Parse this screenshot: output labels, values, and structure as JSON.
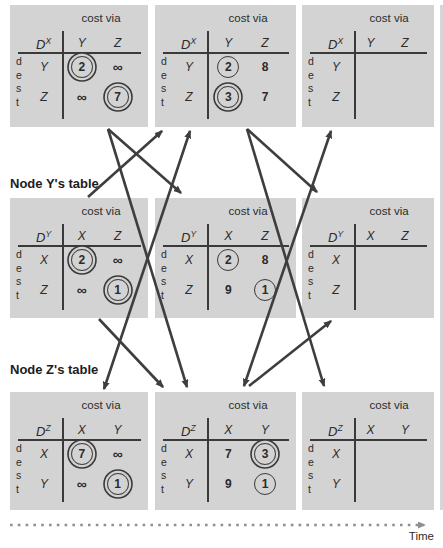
{
  "figure": {
    "header_label": "cost via",
    "dest_label": "d\ne\ns\nt",
    "time_label": "Time",
    "node_y_label": "Node Y's table",
    "node_z_label": "Node Z's table",
    "colors": {
      "table_bg": "#d3d3d3",
      "ink": "#2b2b2b",
      "arrow": "#3e3e3e",
      "timeline": "#8f8f8f"
    },
    "rows": [
      {
        "node": "X",
        "label": null,
        "tables": [
          {
            "d": "D",
            "sup": "X",
            "cols": [
              "Y",
              "Z"
            ],
            "rows": [
              {
                "label": "Y",
                "cells": [
                  {
                    "v": "2",
                    "circle": "double"
                  },
                  {
                    "v": "∞"
                  }
                ]
              },
              {
                "label": "Z",
                "cells": [
                  {
                    "v": "∞"
                  },
                  {
                    "v": "7",
                    "circle": "double"
                  }
                ]
              }
            ]
          },
          {
            "d": "D",
            "sup": "X",
            "cols": [
              "Y",
              "Z"
            ],
            "rows": [
              {
                "label": "Y",
                "cells": [
                  {
                    "v": "2",
                    "circle": "single"
                  },
                  {
                    "v": "8"
                  }
                ]
              },
              {
                "label": "Z",
                "cells": [
                  {
                    "v": "3",
                    "circle": "double"
                  },
                  {
                    "v": "7"
                  }
                ]
              }
            ]
          },
          {
            "d": "D",
            "sup": "X",
            "cols": [
              "Y",
              "Z"
            ],
            "rows": [
              {
                "label": "Y",
                "cells": [
                  {},
                  {}
                ]
              },
              {
                "label": "Z",
                "cells": [
                  {},
                  {}
                ]
              }
            ]
          }
        ]
      },
      {
        "node": "Y",
        "label": "Node Y's table",
        "tables": [
          {
            "d": "D",
            "sup": "Y",
            "cols": [
              "X",
              "Z"
            ],
            "rows": [
              {
                "label": "X",
                "cells": [
                  {
                    "v": "2",
                    "circle": "double"
                  },
                  {
                    "v": "∞"
                  }
                ]
              },
              {
                "label": "Z",
                "cells": [
                  {
                    "v": "∞"
                  },
                  {
                    "v": "1",
                    "circle": "double"
                  }
                ]
              }
            ]
          },
          {
            "d": "D",
            "sup": "Y",
            "cols": [
              "X",
              "Z"
            ],
            "rows": [
              {
                "label": "X",
                "cells": [
                  {
                    "v": "2",
                    "circle": "single"
                  },
                  {
                    "v": "8"
                  }
                ]
              },
              {
                "label": "Z",
                "cells": [
                  {
                    "v": "9"
                  },
                  {
                    "v": "1",
                    "circle": "single"
                  }
                ]
              }
            ]
          },
          {
            "d": "D",
            "sup": "Y",
            "cols": [
              "X",
              "Z"
            ],
            "rows": [
              {
                "label": "X",
                "cells": [
                  {},
                  {}
                ]
              },
              {
                "label": "Z",
                "cells": [
                  {},
                  {}
                ]
              }
            ]
          }
        ]
      },
      {
        "node": "Z",
        "label": "Node Z's table",
        "tables": [
          {
            "d": "D",
            "sup": "Z",
            "cols": [
              "X",
              "Y"
            ],
            "rows": [
              {
                "label": "X",
                "cells": [
                  {
                    "v": "7",
                    "circle": "double"
                  },
                  {
                    "v": "∞"
                  }
                ]
              },
              {
                "label": "Y",
                "cells": [
                  {
                    "v": "∞"
                  },
                  {
                    "v": "1",
                    "circle": "double"
                  }
                ]
              }
            ]
          },
          {
            "d": "D",
            "sup": "Z",
            "cols": [
              "X",
              "Y"
            ],
            "rows": [
              {
                "label": "X",
                "cells": [
                  {
                    "v": "7"
                  },
                  {
                    "v": "3",
                    "circle": "double"
                  }
                ]
              },
              {
                "label": "Y",
                "cells": [
                  {
                    "v": "9"
                  },
                  {
                    "v": "1",
                    "circle": "single"
                  }
                ]
              }
            ]
          },
          {
            "d": "D",
            "sup": "Z",
            "cols": [
              "X",
              "Y"
            ],
            "rows": [
              {
                "label": "X",
                "cells": [
                  {},
                  {}
                ]
              },
              {
                "label": "Y",
                "cells": [
                  {},
                  {}
                ]
              }
            ]
          }
        ]
      }
    ],
    "arrows": [
      {
        "from": "x-t0",
        "to": "y-t1",
        "x1": 108,
        "y1": 129,
        "x2": 181,
        "y2": 193,
        "double": false
      },
      {
        "from": "x-t0",
        "to": "z-t1",
        "x1": 108,
        "y1": 129,
        "x2": 187,
        "y2": 387,
        "double": false
      },
      {
        "from": "y-t0",
        "to": "x-t1",
        "x1": 88,
        "y1": 197,
        "x2": 162,
        "y2": 131,
        "double": false
      },
      {
        "from": "y-t0",
        "to": "z-t1",
        "x1": 99,
        "y1": 319,
        "x2": 163,
        "y2": 387,
        "double": false
      },
      {
        "from": "z-t0",
        "to": "x-t1",
        "x1": 104,
        "y1": 389,
        "x2": 190,
        "y2": 131,
        "double": true
      },
      {
        "from": "x-t1",
        "to": "y-t2",
        "x1": 247,
        "y1": 129,
        "x2": 317,
        "y2": 192,
        "double": false
      },
      {
        "from": "x-t1",
        "to": "z-t2",
        "x1": 247,
        "y1": 129,
        "x2": 324,
        "y2": 386,
        "double": false
      },
      {
        "from": "z-t1",
        "to": "y-t2",
        "x1": 249,
        "y1": 386,
        "x2": 331,
        "y2": 321,
        "double": false
      },
      {
        "from": "z-t1",
        "to": "x-t2",
        "x1": 244,
        "y1": 386,
        "x2": 331,
        "y2": 131,
        "double": true
      }
    ],
    "timeline": {
      "x1": 10,
      "x2": 424,
      "y": 525
    }
  }
}
